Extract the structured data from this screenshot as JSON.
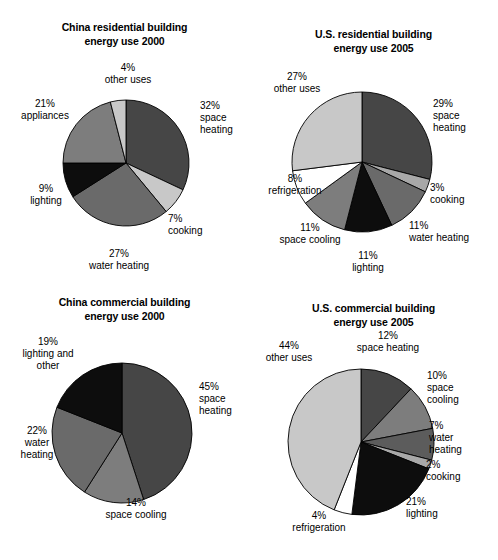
{
  "figure": {
    "background_color": "#ffffff",
    "palette": {
      "dark_gray": "#464646",
      "mid_dark_gray": "#6a6a6a",
      "mid_gray": "#7d7d7d",
      "light_gray": "#c8c8c8",
      "pale_gray": "#a8a8a8",
      "black": "#0d0d0d",
      "white": "#ffffff",
      "outline": "#000000"
    }
  },
  "chart_data": [
    {
      "type": "pie",
      "id": "china-residential",
      "title": "China residential building\nenergy use 2000",
      "start_angle_deg": 0,
      "direction": "clockwise",
      "total_percent": 100,
      "categories": [
        "space heating",
        "cooking",
        "water heating",
        "lighting",
        "appliances",
        "other uses"
      ],
      "values": [
        32,
        7,
        27,
        9,
        21,
        4
      ],
      "slices": [
        {
          "label": "space heating",
          "label_text": "32%\nspace\nheating",
          "value": 32,
          "color": "#464646"
        },
        {
          "label": "cooking",
          "label_text": "7%\ncooking",
          "value": 7,
          "color": "#c8c8c8"
        },
        {
          "label": "water heating",
          "label_text": "27%\nwater heating",
          "value": 27,
          "color": "#6a6a6a"
        },
        {
          "label": "lighting",
          "label_text": "9%\nlighting",
          "value": 9,
          "color": "#0d0d0d"
        },
        {
          "label": "appliances",
          "label_text": "21%\nappliances",
          "value": 21,
          "color": "#7d7d7d"
        },
        {
          "label": "other uses",
          "label_text": "4%\nother uses",
          "value": 4,
          "color": "#c8c8c8"
        }
      ]
    },
    {
      "type": "pie",
      "id": "us-residential",
      "title": "U.S. residential building\nenergy use 2005",
      "start_angle_deg": 0,
      "direction": "clockwise",
      "total_percent": 100,
      "categories": [
        "space heating",
        "cooking",
        "water heating",
        "lighting",
        "space cooling",
        "refrigeration",
        "other uses"
      ],
      "values": [
        29,
        3,
        11,
        11,
        11,
        8,
        27
      ],
      "slices": [
        {
          "label": "space heating",
          "label_text": "29%\nspace\nheating",
          "value": 29,
          "color": "#464646"
        },
        {
          "label": "cooking",
          "label_text": "3%\ncooking",
          "value": 3,
          "color": "#a8a8a8"
        },
        {
          "label": "water heating",
          "label_text": "11%\nwater heating",
          "value": 11,
          "color": "#6a6a6a"
        },
        {
          "label": "lighting",
          "label_text": "11%\nlighting",
          "value": 11,
          "color": "#0d0d0d"
        },
        {
          "label": "space cooling",
          "label_text": "11%\nspace cooling",
          "value": 11,
          "color": "#7d7d7d"
        },
        {
          "label": "refrigeration",
          "label_text": "8%\nrefrigeration",
          "value": 8,
          "color": "#ffffff"
        },
        {
          "label": "other uses",
          "label_text": "27%\nother uses",
          "value": 27,
          "color": "#c8c8c8"
        }
      ]
    },
    {
      "type": "pie",
      "id": "china-commercial",
      "title": "China commercial building\nenergy use 2000",
      "start_angle_deg": 0,
      "direction": "clockwise",
      "total_percent": 100,
      "categories": [
        "space heating",
        "space cooling",
        "water heating",
        "lighting and other"
      ],
      "values": [
        45,
        14,
        22,
        19
      ],
      "slices": [
        {
          "label": "space heating",
          "label_text": "45%\nspace\nheating",
          "value": 45,
          "color": "#464646"
        },
        {
          "label": "space cooling",
          "label_text": "14%\nspace cooling",
          "value": 14,
          "color": "#7d7d7d"
        },
        {
          "label": "water heating",
          "label_text": "22%\nwater\nheating",
          "value": 22,
          "color": "#6a6a6a"
        },
        {
          "label": "lighting and other",
          "label_text": "19%\nlighting and\nother",
          "value": 19,
          "color": "#0d0d0d"
        }
      ]
    },
    {
      "type": "pie",
      "id": "us-commercial",
      "title": "U.S. commercial building\nenergy use 2005",
      "start_angle_deg": 0,
      "direction": "clockwise",
      "total_percent": 100,
      "categories": [
        "space heating",
        "space cooling",
        "water heating",
        "cooking",
        "lighting",
        "refrigeration",
        "other uses"
      ],
      "values": [
        12,
        10,
        7,
        2,
        21,
        4,
        44
      ],
      "slices": [
        {
          "label": "space heating",
          "label_text": "12%\nspace heating",
          "value": 12,
          "color": "#464646"
        },
        {
          "label": "space cooling",
          "label_text": "10%\nspace\ncooling",
          "value": 10,
          "color": "#7d7d7d"
        },
        {
          "label": "water heating",
          "label_text": "7%\nwater\nheating",
          "value": 7,
          "color": "#5c5c5c"
        },
        {
          "label": "cooking",
          "label_text": "2%\ncooking",
          "value": 2,
          "color": "#a8a8a8"
        },
        {
          "label": "lighting",
          "label_text": "21%\nlighting",
          "value": 21,
          "color": "#0d0d0d"
        },
        {
          "label": "refrigeration",
          "label_text": "4%\nrefrigeration",
          "value": 4,
          "color": "#ffffff"
        },
        {
          "label": "other uses",
          "label_text": "44%\nother uses",
          "value": 44,
          "color": "#c8c8c8"
        }
      ]
    }
  ],
  "layout": {
    "pies": [
      {
        "cx": 126,
        "cy": 163,
        "r": 63
      },
      {
        "cx": 113,
        "cy": 162,
        "r": 70
      },
      {
        "cx": 122,
        "cy": 149,
        "r": 70
      },
      {
        "cx": 112,
        "cy": 158,
        "r": 73
      }
    ],
    "label_positions": [
      [
        {
          "x": 200,
          "y": 100,
          "align": "lab-l"
        },
        {
          "x": 168,
          "y": 213,
          "align": "lab-l"
        },
        {
          "x": 119,
          "y": 248,
          "align": "lab-c"
        },
        {
          "x": 46,
          "y": 183,
          "align": "lab-c"
        },
        {
          "x": 45,
          "y": 98,
          "align": "lab-c"
        },
        {
          "x": 128,
          "y": 62,
          "align": "lab-c"
        }
      ],
      [
        {
          "x": 184,
          "y": 98,
          "align": "lab-l"
        },
        {
          "x": 181,
          "y": 182,
          "align": "lab-l"
        },
        {
          "x": 160,
          "y": 220,
          "align": "lab-l"
        },
        {
          "x": 119,
          "y": 250,
          "align": "lab-c"
        },
        {
          "x": 61,
          "y": 222,
          "align": "lab-c"
        },
        {
          "x": 46,
          "y": 173,
          "align": "lab-c"
        },
        {
          "x": 48,
          "y": 71,
          "align": "lab-c"
        }
      ],
      [
        {
          "x": 199,
          "y": 97,
          "align": "lab-l"
        },
        {
          "x": 136,
          "y": 213,
          "align": "lab-c"
        },
        {
          "x": 37,
          "y": 141,
          "align": "lab-c"
        },
        {
          "x": 48,
          "y": 52,
          "align": "lab-c"
        }
      ],
      [
        {
          "x": 139,
          "y": 46,
          "align": "lab-c"
        },
        {
          "x": 178,
          "y": 86,
          "align": "lab-l"
        },
        {
          "x": 180,
          "y": 136,
          "align": "lab-l"
        },
        {
          "x": 177,
          "y": 175,
          "align": "lab-l"
        },
        {
          "x": 157,
          "y": 212,
          "align": "lab-l"
        },
        {
          "x": 70,
          "y": 226,
          "align": "lab-c"
        },
        {
          "x": 40,
          "y": 56,
          "align": "lab-c"
        }
      ]
    ]
  }
}
